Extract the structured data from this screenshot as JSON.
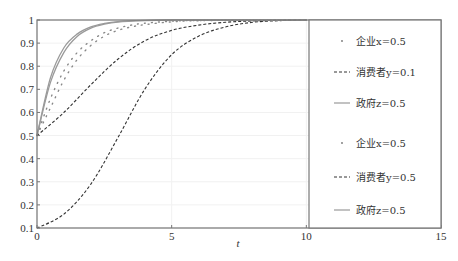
{
  "chart_data": {
    "type": "line",
    "title": "",
    "xlabel": "t",
    "ylabel": "",
    "xlim": [
      0,
      15
    ],
    "ylim": [
      0.1,
      1
    ],
    "xticks": [
      0,
      5,
      10,
      15
    ],
    "yticks": [
      0.1,
      0.2,
      0.3,
      0.4,
      0.5,
      0.6,
      0.7,
      0.8,
      0.9,
      1
    ],
    "ytick_labels": [
      "0.1",
      "0.2",
      "0.3",
      "0.4",
      "0.5",
      "0.6",
      "0.7",
      "0.8",
      "0.9",
      "1"
    ],
    "xtick_labels": [
      "0",
      "5",
      "10",
      "15"
    ],
    "grid": true,
    "legend_position": "right-inside",
    "series": [
      {
        "name": "企业x=0.5",
        "group": 1,
        "style": "dotted",
        "x": [
          0,
          0.5,
          1,
          1.5,
          2,
          2.5,
          3,
          3.5,
          4,
          5,
          6,
          8,
          10
        ],
        "y": [
          0.5,
          0.66,
          0.78,
          0.86,
          0.91,
          0.945,
          0.965,
          0.978,
          0.986,
          0.995,
          0.998,
          1.0,
          1.0
        ]
      },
      {
        "name": "消费者y=0.1",
        "group": 1,
        "style": "dashed",
        "x": [
          0,
          1,
          2,
          3,
          4,
          5,
          6,
          7,
          8,
          9,
          10
        ],
        "y": [
          0.1,
          0.16,
          0.29,
          0.49,
          0.7,
          0.85,
          0.93,
          0.97,
          0.99,
          0.997,
          1.0
        ]
      },
      {
        "name": "政府z=0.5",
        "group": 1,
        "style": "solid",
        "x": [
          0,
          0.5,
          1,
          1.5,
          2,
          2.5,
          3,
          4,
          5,
          6,
          8,
          10
        ],
        "y": [
          0.5,
          0.75,
          0.88,
          0.94,
          0.97,
          0.985,
          0.993,
          0.998,
          1.0,
          1.0,
          1.0,
          1.0
        ]
      },
      {
        "name": "企业x=0.5",
        "group": 2,
        "style": "dotted",
        "x": [
          0,
          0.5,
          1,
          1.5,
          2,
          2.5,
          3,
          3.5,
          4,
          5,
          6,
          8,
          10
        ],
        "y": [
          0.5,
          0.62,
          0.74,
          0.83,
          0.89,
          0.93,
          0.955,
          0.97,
          0.98,
          0.992,
          0.997,
          1.0,
          1.0
        ]
      },
      {
        "name": "消费者y=0.5",
        "group": 2,
        "style": "dashed",
        "x": [
          0,
          1,
          2,
          3,
          4,
          5,
          6,
          7,
          8,
          9,
          10
        ],
        "y": [
          0.5,
          0.6,
          0.72,
          0.83,
          0.91,
          0.955,
          0.978,
          0.99,
          0.996,
          0.999,
          1.0
        ]
      },
      {
        "name": "政府z=0.5",
        "group": 2,
        "style": "solid",
        "x": [
          0,
          0.5,
          1,
          1.5,
          2,
          2.5,
          3,
          4,
          5,
          6,
          8,
          10
        ],
        "y": [
          0.5,
          0.73,
          0.86,
          0.93,
          0.965,
          0.982,
          0.991,
          0.997,
          1.0,
          1.0,
          1.0,
          1.0
        ]
      }
    ],
    "legend": [
      {
        "label": "企业x=0.5",
        "marker": "dot"
      },
      {
        "label": "消费者y=0.1",
        "marker": "dashed"
      },
      {
        "label": "政府z=0.5",
        "marker": "solid"
      },
      {
        "label": "企业x=0.5",
        "marker": "dot"
      },
      {
        "label": "消费者y=0.5",
        "marker": "dashed"
      },
      {
        "label": "政府z=0.5",
        "marker": "solid"
      }
    ]
  }
}
